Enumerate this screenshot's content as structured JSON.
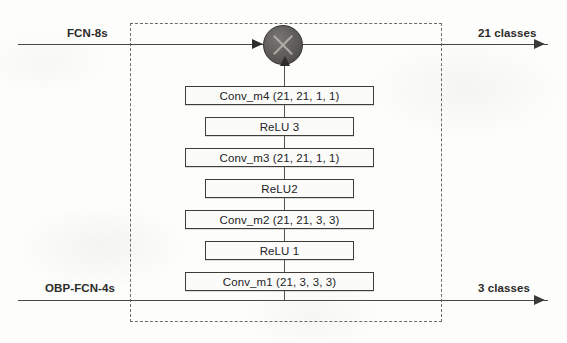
{
  "diagram": {
    "region_label": "module-boundary",
    "inputs": [
      {
        "id": "fcn8s",
        "label": "FCN-8s",
        "position": "top-left"
      },
      {
        "id": "obp_fcn4s",
        "label": "OBP-FCN-4s",
        "position": "bottom-left"
      }
    ],
    "outputs": [
      {
        "id": "out21",
        "label": "21 classes",
        "position": "top-right"
      },
      {
        "id": "out3",
        "label": "3 classes",
        "position": "bottom-right"
      }
    ],
    "merge_node": {
      "name": "sum-node",
      "glyph": "cross-circle",
      "fill": "#5d5b58",
      "stroke": "#35332f"
    },
    "layers": [
      {
        "id": "conv_m4",
        "type": "conv",
        "label": "Conv_m4 (21, 21, 1, 1)",
        "top": 86
      },
      {
        "id": "relu3",
        "type": "relu",
        "label": "ReLU 3",
        "top": 117
      },
      {
        "id": "conv_m3",
        "type": "conv",
        "label": "Conv_m3 (21, 21, 1, 1)",
        "top": 148
      },
      {
        "id": "relu2",
        "type": "relu",
        "label": "ReLU2",
        "top": 179
      },
      {
        "id": "conv_m2",
        "type": "conv",
        "label": "Conv_m2 (21, 21, 3, 3)",
        "top": 210
      },
      {
        "id": "relu1",
        "type": "relu",
        "label": "ReLU 1",
        "top": 241
      },
      {
        "id": "conv_m1",
        "type": "conv",
        "label": "Conv_m1 (21, 3, 3, 3)",
        "top": 272
      }
    ],
    "colors": {
      "line": "#4a4846",
      "dashed_border": "#6e6c68",
      "box_border": "#3f3d3a",
      "text": "#23221f"
    }
  }
}
